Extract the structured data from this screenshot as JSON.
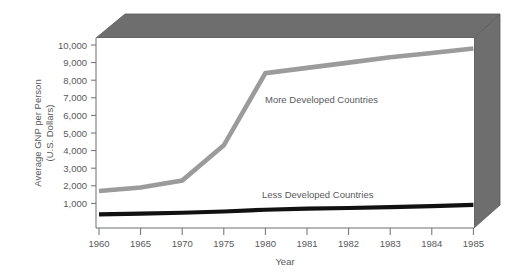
{
  "chart_data": {
    "type": "line",
    "title": "",
    "xlabel": "Year",
    "ylabel_line1": "Average GNP per Person",
    "ylabel_line2": "(U.S. Dollars)",
    "categories": [
      "1960",
      "1965",
      "1970",
      "1975",
      "1980",
      "1981",
      "1982",
      "1983",
      "1984",
      "1985"
    ],
    "ytick_labels": [
      "10,000",
      "9,000",
      "8,000",
      "7,000",
      "6,000",
      "5,000",
      "4,000",
      "3,000",
      "2,000",
      "1,000"
    ],
    "ytick_values": [
      10000,
      9000,
      8000,
      7000,
      6000,
      5000,
      4000,
      3000,
      2000,
      1000
    ],
    "ylim": [
      0,
      10600
    ],
    "grid": false,
    "legend_position": "inline-annotations",
    "series": [
      {
        "name": "More Developed Countries",
        "color": "#9b9b9b",
        "values": [
          1700,
          1900,
          2300,
          4300,
          8400,
          8700,
          9000,
          9300,
          9550,
          9800
        ],
        "label_x": 265,
        "label_y": 103
      },
      {
        "name": "Less Developed Countries",
        "color": "#111111",
        "values": [
          380,
          420,
          470,
          540,
          640,
          700,
          740,
          790,
          850,
          920
        ],
        "label_x": 262,
        "label_y": 198
      }
    ]
  },
  "frame": {
    "top_band_color": "#6e6e6e",
    "right_panel_color": "#6e6e6e",
    "plot_background": "#ffffff",
    "axis_color": "#6d6e71"
  }
}
